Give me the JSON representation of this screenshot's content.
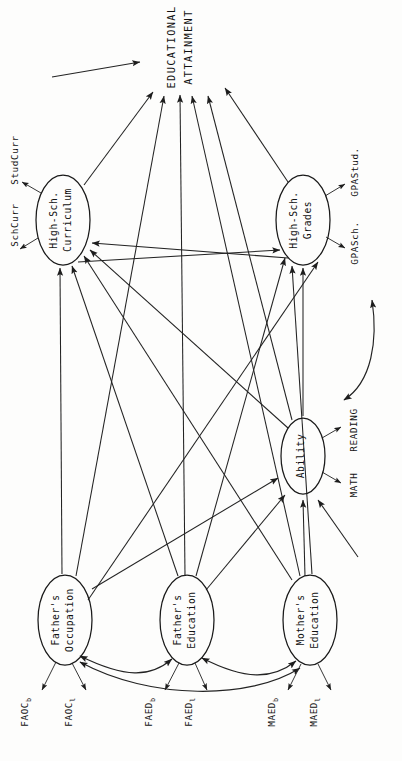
{
  "figure": {
    "type": "sem-path-diagram",
    "orientation": "rotated-90-ccw",
    "background_color": "#fdfdfc",
    "line_color": "#232323"
  },
  "outcome": {
    "name": "educational-attainment",
    "line1": "EDUCATIONAL",
    "line2": "ATTAINMENT"
  },
  "latent_nodes": [
    {
      "id": "hs-curriculum",
      "line1": "High-Sch.",
      "line2": "Curriculum",
      "cx": 63,
      "cy": 220,
      "rx": 27,
      "ry": 45
    },
    {
      "id": "hs-grades",
      "line1": "High-Sch.",
      "line2": "Grades",
      "cx": 303,
      "cy": 220,
      "rx": 27,
      "ry": 45
    },
    {
      "id": "ability",
      "line1": "Ability",
      "line2": "",
      "cx": 303,
      "cy": 456,
      "rx": 22,
      "ry": 38
    },
    {
      "id": "fathers-occupation",
      "line1": "Father's",
      "line2": "Occupation",
      "cx": 65,
      "cy": 620,
      "rx": 27,
      "ry": 45
    },
    {
      "id": "fathers-education",
      "line1": "Father's",
      "line2": "Education",
      "cx": 187,
      "cy": 620,
      "rx": 27,
      "ry": 45
    },
    {
      "id": "mothers-education",
      "line1": "Mother's",
      "line2": "Education",
      "cx": 310,
      "cy": 620,
      "rx": 27,
      "ry": 45
    }
  ],
  "observed_indicators": [
    {
      "id": "schcurr",
      "base": "SchCurr",
      "sub": "",
      "x": 18,
      "y": 225
    },
    {
      "id": "studcurr",
      "base": "StudCurr",
      "sub": "",
      "x": 18,
      "y": 160
    },
    {
      "id": "gpasch",
      "base": "GPASch.",
      "sub": "",
      "x": 358,
      "y": 243
    },
    {
      "id": "gpastud",
      "base": "GPAStud.",
      "sub": "",
      "x": 358,
      "y": 172
    },
    {
      "id": "math",
      "base": "MATH",
      "sub": "",
      "x": 357,
      "y": 485
    },
    {
      "id": "reading",
      "base": "READING",
      "sub": "",
      "x": 357,
      "y": 430
    },
    {
      "id": "faoc-b",
      "base": "FAOC",
      "sub": "b",
      "x": 28,
      "y": 712
    },
    {
      "id": "faoc-l",
      "base": "FAOC",
      "sub": "l",
      "x": 72,
      "y": 712
    },
    {
      "id": "faed-b",
      "base": "FAED",
      "sub": "b",
      "x": 152,
      "y": 712
    },
    {
      "id": "faed-l",
      "base": "FAED",
      "sub": "l",
      "x": 192,
      "y": 712
    },
    {
      "id": "maed-b",
      "base": "MAED",
      "sub": "b",
      "x": 275,
      "y": 712
    },
    {
      "id": "maed-l",
      "base": "MAED",
      "sub": "l",
      "x": 317,
      "y": 712
    }
  ],
  "structural_paths": [
    {
      "from": "hs-curriculum",
      "to": "educational-attainment"
    },
    {
      "from": "hs-grades",
      "to": "educational-attainment"
    },
    {
      "from": "ability",
      "to": "educational-attainment"
    },
    {
      "from": "fathers-occupation",
      "to": "educational-attainment"
    },
    {
      "from": "fathers-education",
      "to": "educational-attainment"
    },
    {
      "from": "mothers-education",
      "to": "educational-attainment"
    },
    {
      "from": "ability",
      "to": "hs-curriculum"
    },
    {
      "from": "ability",
      "to": "hs-grades"
    },
    {
      "from": "fathers-occupation",
      "to": "hs-curriculum"
    },
    {
      "from": "fathers-education",
      "to": "hs-curriculum"
    },
    {
      "from": "mothers-education",
      "to": "hs-curriculum"
    },
    {
      "from": "fathers-occupation",
      "to": "hs-grades"
    },
    {
      "from": "fathers-education",
      "to": "hs-grades"
    },
    {
      "from": "mothers-education",
      "to": "hs-grades"
    },
    {
      "from": "fathers-occupation",
      "to": "ability"
    },
    {
      "from": "fathers-education",
      "to": "ability"
    },
    {
      "from": "mothers-education",
      "to": "ability"
    }
  ],
  "covariances": [
    {
      "from": "fathers-occupation",
      "to": "fathers-education"
    },
    {
      "from": "fathers-education",
      "to": "mothers-education"
    },
    {
      "from": "fathers-occupation",
      "to": "mothers-education"
    },
    {
      "from": "hs-grades",
      "to": "ability"
    }
  ],
  "disturbances": [
    {
      "id": "disturbance-attainment",
      "target": "educational-attainment"
    },
    {
      "id": "disturbance-ability",
      "target": "ability"
    }
  ]
}
